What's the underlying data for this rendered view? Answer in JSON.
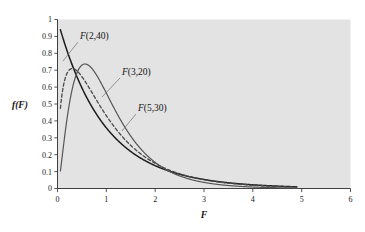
{
  "figure": {
    "title": "",
    "background_color": "#ffffff",
    "plot_background_color": "#e3e3e3"
  },
  "chart_data": {
    "type": "line",
    "title": "",
    "subtitle": "",
    "xlabel": "F",
    "ylabel": "f(F)",
    "xlim": [
      0,
      6
    ],
    "ylim": [
      0,
      1
    ],
    "grid": false,
    "legend_position": "inline-annotations",
    "x_ticks": [
      0,
      1,
      2,
      3,
      4,
      5,
      6
    ],
    "x_tick_labels": [
      "0",
      "1",
      "2",
      "3",
      "4",
      "5",
      "6"
    ],
    "y_ticks": [
      0,
      0.1,
      0.2,
      0.3,
      0.4,
      0.5,
      0.6,
      0.7,
      0.8,
      0.9,
      1
    ],
    "y_tick_labels": [
      "0",
      "0.1",
      "0.2",
      "0.3",
      "0.4",
      "0.5",
      "0.6",
      "0.7",
      "0.8",
      "0.9",
      "1"
    ],
    "x_domain_drawn": [
      0.06,
      4.9
    ],
    "series": [
      {
        "name": "F(2,40)",
        "label": "F(2,40)",
        "d1": 2,
        "d2": 40,
        "style": "solid",
        "color": "#1d1d1d",
        "width": 1.5,
        "peak_x": 0.0,
        "peak_y": 1.0,
        "start_y": 0.91,
        "values_at": {
          "0.1": 0.905,
          "0.3": 0.715,
          "0.5": 0.575,
          "0.75": 0.44,
          "1.0": 0.335,
          "1.5": 0.2,
          "2.0": 0.125,
          "2.5": 0.08,
          "3.0": 0.05,
          "4.0": 0.02,
          "4.9": 0.009
        }
      },
      {
        "name": "F(5,30)",
        "label": "F(5,30)",
        "d1": 5,
        "d2": 30,
        "style": "solid",
        "color": "#555555",
        "width": 1.2,
        "peak_x": 0.3,
        "peak_y": 0.712,
        "values_at": {
          "0.06": 0.1,
          "0.15": 0.5,
          "0.3": 0.712,
          "0.5": 0.69,
          "0.75": 0.55,
          "1.0": 0.4,
          "1.5": 0.2,
          "2.0": 0.105,
          "2.5": 0.06,
          "3.0": 0.035,
          "4.0": 0.013,
          "4.9": 0.006
        }
      },
      {
        "name": "F(3,20)",
        "label": "F(3,20)",
        "d1": 3,
        "d2": 20,
        "style": "dashed",
        "color": "#4a4a4a",
        "width": 1.3,
        "peak_x": 0.55,
        "peak_y": 0.735,
        "values_at": {
          "0.06": 0.12,
          "0.2": 0.46,
          "0.4": 0.69,
          "0.55": 0.735,
          "0.75": 0.705,
          "1.0": 0.6,
          "1.5": 0.36,
          "2.0": 0.2,
          "2.5": 0.115,
          "3.0": 0.07,
          "4.0": 0.028,
          "4.9": 0.012
        }
      }
    ],
    "annotations": [
      {
        "name": "label-f-2-40",
        "text": "F(2,40)",
        "fn_part": "F",
        "args_part": "(2,40)",
        "text_x": 80,
        "text_y": 39,
        "leader_from": [
          78,
          42
        ],
        "leader_to": [
          63,
          61
        ]
      },
      {
        "name": "label-f-3-20",
        "text": "F(3,20)",
        "fn_part": "F",
        "args_part": "(3,20)",
        "text_x": 122,
        "text_y": 75,
        "leader_from": [
          120,
          78
        ],
        "leader_to": [
          102,
          97
        ]
      },
      {
        "name": "label-f-5-30",
        "text": "F(5,30)",
        "fn_part": "F",
        "args_part": "(5,30)",
        "text_x": 138,
        "text_y": 111,
        "leader_from": [
          136,
          114
        ],
        "leader_to": [
          122,
          131
        ]
      }
    ]
  }
}
